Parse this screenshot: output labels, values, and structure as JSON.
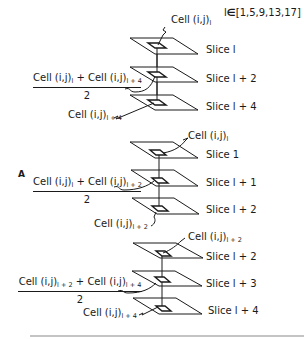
{
  "set_condition": {
    "var": "l",
    "symbol": "∈",
    "values": "[1,5,9,13,17]"
  },
  "label_a": "A",
  "panels": [
    {
      "top_cell": {
        "base": "Cell (i,j)",
        "sub": "l"
      },
      "slices": [
        "Slice l",
        "Slice l + 2",
        "Slice l + 4"
      ],
      "fraction": {
        "term1_base": "Cell (i,j)",
        "term1_sub": "l",
        "plus": " + ",
        "term2_base": "Cell (i,j)",
        "term2_sub": "l + 4",
        "denominator": "2"
      },
      "bottom_cell": {
        "base": "Cell (i,j)",
        "sub": "l + 4"
      }
    },
    {
      "top_cell": {
        "base": "Cell (i,j)",
        "sub": "l"
      },
      "slices": [
        "Slice 1",
        "Slice l + 1",
        "Slice l + 2"
      ],
      "fraction": {
        "term1_base": "Cell (i,j)",
        "term1_sub": "l",
        "plus": " + ",
        "term2_base": "Cell (i,j)",
        "term2_sub": "l + 2",
        "denominator": "2"
      },
      "bottom_cell": {
        "base": "Cell (i,j)",
        "sub": "l + 2"
      }
    },
    {
      "top_cell": {
        "base": "Cell (i,j)",
        "sub": "l + 2"
      },
      "slices": [
        "Slice l + 2",
        "Slice l + 3",
        "Slice l + 4"
      ],
      "fraction": {
        "term1_base": "Cell (i,j)",
        "term1_sub": "l + 2",
        "plus": " + ",
        "term2_base": "Cell (i,j)",
        "term2_sub": "l + 4",
        "denominator": "2"
      },
      "bottom_cell": {
        "base": "Cell (i,j)",
        "sub": "l + 4"
      }
    }
  ],
  "colors": {
    "ink": "#1a1a1a",
    "background": "#ffffff",
    "rule": "#777777"
  }
}
